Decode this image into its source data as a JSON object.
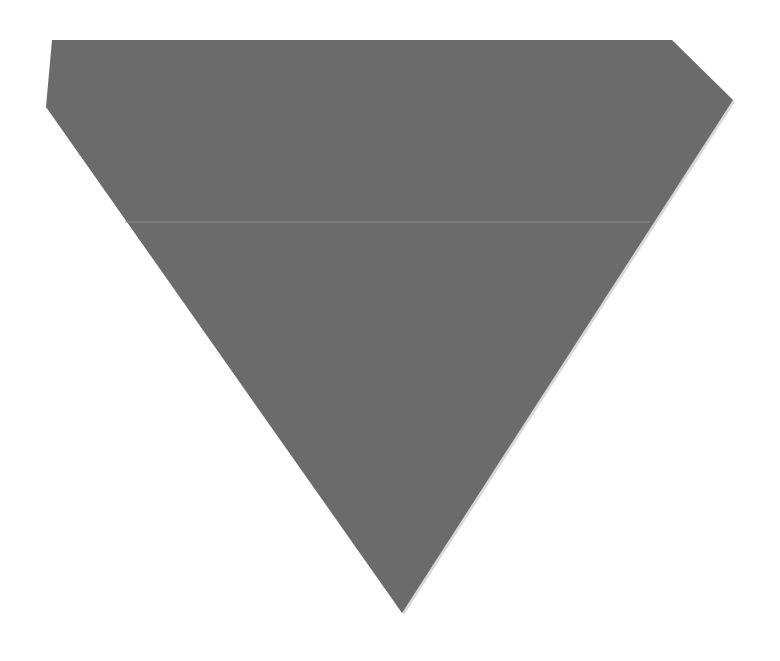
{
  "scene": {
    "background": "#ffffff",
    "shape": {
      "kind": "inverted-pentagon",
      "fill": "#6b6b6b",
      "edge": "#d8d8d8",
      "points": "52,40 672,40 733,100 402,613 46,107"
    },
    "crease": {
      "y": 222,
      "x1": 125,
      "x2": 650,
      "color": "#8a8a8a"
    }
  }
}
